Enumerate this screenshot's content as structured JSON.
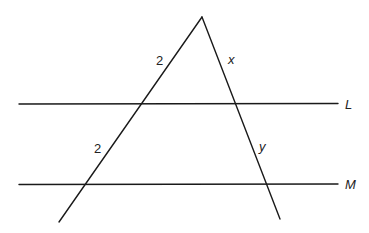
{
  "diagram": {
    "lines": {
      "L": {
        "label": "L"
      },
      "M": {
        "label": "M"
      }
    },
    "segments": {
      "left_upper": {
        "label": "2"
      },
      "left_lower": {
        "label": "2"
      },
      "right_upper": {
        "label": "x"
      },
      "right_lower": {
        "label": "y"
      }
    },
    "colors": {
      "stroke": "#1a1a1a",
      "background": "#ffffff"
    }
  }
}
